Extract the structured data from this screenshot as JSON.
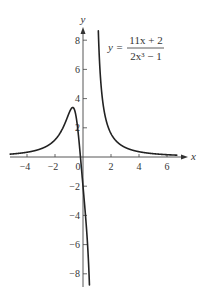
{
  "chart_data": {
    "type": "line",
    "title": "",
    "equation": {
      "lhs": "y =",
      "numerator": "11x + 2",
      "denominator": "2x³ − 1"
    },
    "xlabel": "x",
    "ylabel": "y",
    "xlim": [
      -5.2,
      7.3
    ],
    "ylim": [
      -8.8,
      9.2
    ],
    "xticks": [
      -4,
      -2,
      0,
      2,
      4,
      6
    ],
    "xtick_labels": [
      "−4",
      "−2",
      "0",
      "2",
      "4",
      "6"
    ],
    "yticks": [
      8,
      6,
      4,
      2,
      -2,
      -4,
      -6,
      -8
    ],
    "ytick_labels": [
      "8",
      "6",
      "4",
      "2",
      "−2",
      "−4",
      "−6",
      "−8"
    ],
    "grid": false,
    "legend": null,
    "vertical_asymptote": 0.7937,
    "horizontal_asymptote": 0,
    "series": [
      {
        "name": "left branch",
        "x": [
          -5.2,
          -5,
          -4.5,
          -4,
          -3.5,
          -3,
          -2.5,
          -2,
          -1.75,
          -1.5,
          -1.25,
          -1.1,
          -1,
          -0.9,
          -0.8,
          -0.7,
          -0.6,
          -0.55,
          -0.5,
          -0.45,
          -0.4,
          -0.35,
          -0.3,
          -0.25,
          -0.2,
          -0.15,
          -0.1,
          -0.05,
          0,
          0.05,
          0.1,
          0.15,
          0.2,
          0.25,
          0.3,
          0.35,
          0.4,
          0.45
        ],
        "y": [
          0.202,
          0.211,
          0.261,
          0.326,
          0.421,
          0.564,
          0.787,
          1.176,
          1.468,
          1.871,
          2.386,
          2.738,
          3.0,
          3.22,
          3.36,
          3.39,
          3.21,
          3.04,
          2.8,
          2.49,
          2.1,
          1.64,
          1.23,
          0.74,
          0.2,
          -0.35,
          -0.89,
          -1.45,
          -2.0,
          -2.55,
          -3.12,
          -3.72,
          -4.35,
          -5.03,
          -5.6,
          -6.53,
          -7.34,
          -8.22
        ]
      },
      {
        "name": "right branch",
        "x": [
          0.955,
          0.97,
          1.0,
          1.05,
          1.1,
          1.2,
          1.3,
          1.4,
          1.5,
          1.75,
          2,
          2.5,
          3,
          3.5,
          4,
          4.5,
          5,
          5.5,
          6,
          6.5,
          6.7
        ],
        "y": [
          9.0,
          8.4,
          13.0,
          9.66,
          8.5,
          6.19,
          4.85,
          3.89,
          3.22,
          2.14,
          1.6,
          0.96,
          0.66,
          0.48,
          0.362,
          0.283,
          0.229,
          0.19,
          0.158,
          0.134,
          0.126
        ]
      }
    ]
  }
}
